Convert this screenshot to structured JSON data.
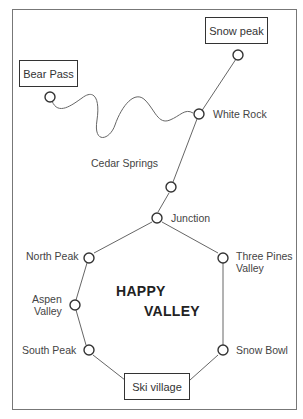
{
  "map": {
    "title_line1": "HAPPY",
    "title_line2": "VALLEY",
    "boxed_locations": {
      "snow_peak": "Snow peak",
      "bear_pass": "Bear Pass",
      "ski_village": "Ski village"
    },
    "stops": {
      "white_rock": "White Rock",
      "cedar_springs": "Cedar Springs",
      "junction": "Junction",
      "north_peak": "North Peak",
      "three_pines_1": "Three Pines",
      "three_pines_2": "Valley",
      "aspen_1": "Aspen",
      "aspen_2": "Valley",
      "south_peak": "South Peak",
      "snow_bowl": "Snow Bowl"
    }
  }
}
